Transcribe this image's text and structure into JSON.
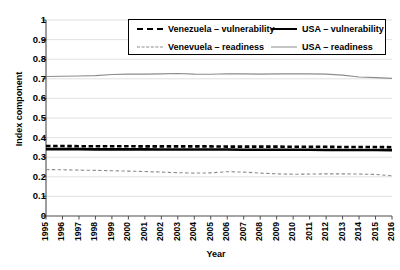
{
  "chart_data": {
    "type": "line",
    "title": "",
    "xlabel": "Year",
    "ylabel": "Index component",
    "x": [
      1995,
      1996,
      1997,
      1998,
      1999,
      2000,
      2001,
      2002,
      2003,
      2004,
      2005,
      2006,
      2007,
      2008,
      2009,
      2010,
      2011,
      2012,
      2013,
      2014,
      2015,
      2016
    ],
    "xtick_labels": [
      "1995",
      "1996",
      "1997",
      "1998",
      "1999",
      "2000",
      "2001",
      "2002",
      "2003",
      "2004",
      "2005",
      "2006",
      "2007",
      "2008",
      "2009",
      "2010",
      "2011",
      "2012",
      "2013",
      "2014",
      "2015",
      "2016"
    ],
    "ytick_labels": [
      "1",
      "0.9",
      "0.8",
      "0.7",
      "0.6",
      "0.5",
      "0.4",
      "0.3",
      "0.2",
      "0.1",
      "0"
    ],
    "ytick_values": [
      1,
      0.9,
      0.8,
      0.7,
      0.6,
      0.5,
      0.4,
      0.3,
      0.2,
      0.1,
      0
    ],
    "ylim": [
      0,
      1
    ],
    "xlim": [
      1995,
      2016
    ],
    "grid": "horizontal",
    "legend_position": "top-center",
    "series": [
      {
        "name": "Venezuela – vulnerability",
        "style": "dashed",
        "width": "thick",
        "color": "#000000",
        "values": [
          0.357,
          0.357,
          0.356,
          0.356,
          0.356,
          0.356,
          0.355,
          0.355,
          0.355,
          0.355,
          0.355,
          0.354,
          0.354,
          0.354,
          0.354,
          0.353,
          0.353,
          0.353,
          0.352,
          0.352,
          0.352,
          0.351
        ]
      },
      {
        "name": "USA – vulnerability",
        "style": "solid",
        "width": "thick",
        "color": "#000000",
        "values": [
          0.341,
          0.341,
          0.341,
          0.34,
          0.34,
          0.34,
          0.34,
          0.339,
          0.339,
          0.339,
          0.339,
          0.339,
          0.338,
          0.338,
          0.338,
          0.338,
          0.338,
          0.337,
          0.337,
          0.337,
          0.337,
          0.336
        ]
      },
      {
        "name": "Venevuela – readiness",
        "style": "dashed",
        "width": "thin",
        "color": "#8c8c8c",
        "values": [
          0.237,
          0.236,
          0.234,
          0.233,
          0.231,
          0.229,
          0.227,
          0.224,
          0.221,
          0.219,
          0.22,
          0.226,
          0.224,
          0.219,
          0.215,
          0.213,
          0.214,
          0.215,
          0.215,
          0.214,
          0.212,
          0.205
        ]
      },
      {
        "name": "USA – readiness",
        "style": "solid",
        "width": "thin",
        "color": "#8c8c8c",
        "values": [
          0.712,
          0.713,
          0.714,
          0.716,
          0.722,
          0.724,
          0.724,
          0.725,
          0.727,
          0.724,
          0.723,
          0.726,
          0.725,
          0.724,
          0.725,
          0.726,
          0.725,
          0.724,
          0.719,
          0.709,
          0.706,
          0.702
        ]
      }
    ]
  },
  "legend": {
    "entries": [
      {
        "label": "Venezuela – vulnerability"
      },
      {
        "label": "USA – vulnerability"
      },
      {
        "label": "Venevuela – readiness"
      },
      {
        "label": "USA – readiness"
      }
    ]
  },
  "axes": {
    "x_title": "Year",
    "y_title": "Index component"
  }
}
